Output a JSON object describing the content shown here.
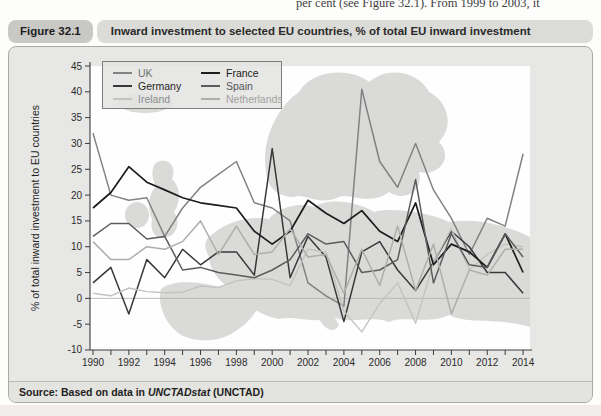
{
  "page": {
    "top_text": "per cent (see Figure 32.1). From 1999 to 2003, it"
  },
  "figure": {
    "label": "Figure 32.1",
    "title": "Inward investment to selected EU countries, % of total EU inward investment",
    "source_prefix": "Source: Based on data in ",
    "source_italic": "UNCTADstat",
    "source_suffix": " (UNCTAD)"
  },
  "chart_data": {
    "type": "line",
    "title": "Inward investment to selected EU countries, % of total EU inward investment",
    "xlabel": "",
    "ylabel": "% of total inward investment to EU countries",
    "ylim": [
      -10,
      45
    ],
    "ytick_step": 5,
    "grid": false,
    "zero_line": true,
    "legend_position": "top-left",
    "background_decoration": "light-gray-europe-map",
    "x": [
      1990,
      1991,
      1992,
      1993,
      1994,
      1995,
      1996,
      1997,
      1998,
      1999,
      2000,
      2001,
      2002,
      2003,
      2004,
      2005,
      2006,
      2007,
      2008,
      2009,
      2010,
      2011,
      2012,
      2013,
      2014
    ],
    "xtick_labels": [
      "1990",
      "1992",
      "1994",
      "1996",
      "1998",
      "2000",
      "2002",
      "2004",
      "2006",
      "2008",
      "2010",
      "2012",
      "2014"
    ],
    "series": [
      {
        "name": "UK",
        "color": "#828282",
        "label_color": "#6f6f6f",
        "width": 1.5,
        "values": [
          32,
          20,
          19,
          19.5,
          12,
          17.5,
          21.5,
          24,
          26.5,
          18.5,
          17.5,
          15,
          3,
          0.5,
          -1.5,
          40.5,
          26.5,
          21.5,
          30,
          21,
          15.5,
          8.5,
          15.5,
          14,
          28
        ]
      },
      {
        "name": "Germany",
        "color": "#383838",
        "label_color": "#1f1f1f",
        "width": 1.5,
        "values": [
          3,
          6,
          -3,
          7.5,
          4,
          9.5,
          6.5,
          9,
          9,
          4.5,
          29,
          4,
          12,
          8,
          -4.5,
          9,
          11,
          5.5,
          1.5,
          7,
          13,
          10,
          5,
          5,
          1
        ]
      },
      {
        "name": "Ireland",
        "color": "#c3c3c1",
        "label_color": "#8c8c8c",
        "width": 1.4,
        "values": [
          1,
          0.5,
          2,
          1.3,
          1.1,
          1.2,
          2.4,
          2.1,
          3.4,
          3.8,
          3.7,
          2.5,
          9.5,
          9,
          -2.5,
          -6.5,
          -1,
          3,
          -4.8,
          7,
          13.5,
          5.5,
          8.5,
          10.5,
          10
        ]
      },
      {
        "name": "France",
        "color": "#1d1d1d",
        "label_color": "#1a1a1a",
        "width": 1.7,
        "values": [
          17.5,
          20.5,
          25.5,
          22.5,
          21,
          19.5,
          18.5,
          18,
          17.5,
          13,
          10.5,
          13,
          19,
          16.5,
          14.5,
          17,
          13,
          11,
          18.5,
          6.5,
          10.5,
          9,
          6,
          12.5,
          5
        ]
      },
      {
        "name": "Spain",
        "color": "#5c5c5c",
        "label_color": "#555555",
        "width": 1.5,
        "values": [
          12,
          14.5,
          14.5,
          11.5,
          12,
          5.5,
          6,
          5,
          4.5,
          4,
          5.5,
          7.5,
          12.5,
          10.5,
          11,
          5,
          5.5,
          7.5,
          23,
          3,
          12.5,
          6.5,
          6,
          12.5,
          8
        ]
      },
      {
        "name": "Netherlands",
        "color": "#aeaeac",
        "label_color": "#a2a2a0",
        "width": 1.5,
        "values": [
          11,
          7.5,
          7.5,
          10,
          9.5,
          11,
          15,
          8.5,
          14,
          8.5,
          9,
          13.5,
          8,
          8.5,
          1,
          9.5,
          2.5,
          14,
          1.5,
          10.5,
          -3,
          5.5,
          4.5,
          9.5,
          9.5
        ]
      }
    ]
  }
}
